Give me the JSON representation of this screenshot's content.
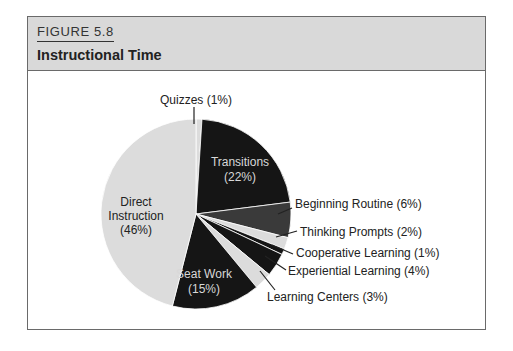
{
  "figure": {
    "number": "FIGURE 5.8",
    "title": "Instructional Time"
  },
  "colors": {
    "header_bg": "#d9d9d9",
    "black": "#151515",
    "dark_gray": "#3a3a3a",
    "light_gray": "#dcdcdc",
    "frame": "#6a6a6a"
  },
  "chart_data": {
    "type": "pie",
    "title": "Instructional Time",
    "start_angle": "12 o'clock",
    "direction": "clockwise",
    "slices": [
      {
        "label": "Quizzes",
        "value": 1,
        "display": "Quizzes (1%)",
        "color": "#dcdcdc",
        "label_position": "outside"
      },
      {
        "label": "Transitions",
        "value": 22,
        "display": "Transitions (22%)",
        "color": "#151515",
        "label_position": "inside"
      },
      {
        "label": "Beginning Routine",
        "value": 6,
        "display": "Beginning Routine (6%)",
        "color": "#3a3a3a",
        "label_position": "outside"
      },
      {
        "label": "Thinking Prompts",
        "value": 2,
        "display": "Thinking Prompts (2%)",
        "color": "#dcdcdc",
        "label_position": "outside"
      },
      {
        "label": "Cooperative Learning",
        "value": 1,
        "display": "Cooperative Learning (1%)",
        "color": "#151515",
        "label_position": "outside"
      },
      {
        "label": "Experiential Learning",
        "value": 4,
        "display": "Experiential Learning (4%)",
        "color": "#151515",
        "label_position": "outside"
      },
      {
        "label": "Learning Centers",
        "value": 3,
        "display": "Learning Centers (3%)",
        "color": "#dcdcdc",
        "label_position": "outside"
      },
      {
        "label": "Seat Work",
        "value": 15,
        "display": "Seat Work (15%)",
        "color": "#151515",
        "label_position": "inside"
      },
      {
        "label": "Direct Instruction",
        "value": 46,
        "display": "Direct Instruction (46%)",
        "color": "#dcdcdc",
        "label_position": "inside"
      }
    ]
  },
  "labels": {
    "quizzes": "Quizzes (1%)",
    "transitions_1": "Transitions",
    "transitions_2": "(22%)",
    "beginning_routine": "Beginning Routine (6%)",
    "thinking_prompts": "Thinking Prompts (2%)",
    "cooperative_learning": "Cooperative Learning (1%)",
    "experiential_learning": "Experiential Learning (4%)",
    "learning_centers": "Learning Centers (3%)",
    "seat_work_1": "Seat Work",
    "seat_work_2": "(15%)",
    "direct_1": "Direct",
    "direct_2": "Instruction",
    "direct_3": "(46%)"
  }
}
